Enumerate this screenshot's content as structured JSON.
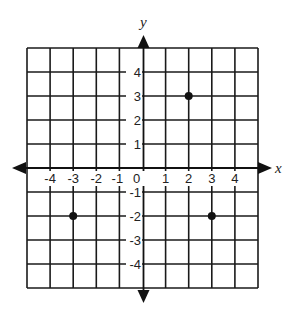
{
  "chart_data": {
    "type": "scatter",
    "title": "",
    "xlabel": "x",
    "ylabel": "y",
    "xlim": [
      -5,
      5
    ],
    "ylim": [
      -5,
      5
    ],
    "grid": true,
    "x_ticks": [
      "-4",
      "-3",
      "-2",
      "-1",
      "0",
      "1",
      "2",
      "3",
      "4"
    ],
    "y_ticks": [
      "4",
      "3",
      "2",
      "1",
      "-1",
      "-2",
      "-3",
      "-4"
    ],
    "series": [
      {
        "name": "points",
        "points": [
          {
            "x": 2,
            "y": 3
          },
          {
            "x": -3,
            "y": -2
          },
          {
            "x": 3,
            "y": -2
          }
        ]
      }
    ]
  },
  "colors": {
    "line": "#1a1a1a",
    "point": "#111111",
    "background": "#ffffff"
  }
}
